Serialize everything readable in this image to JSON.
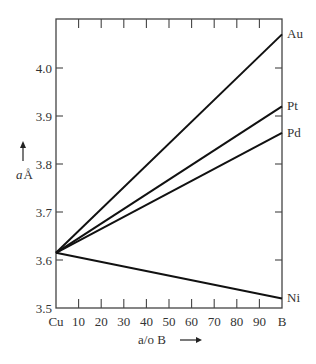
{
  "chart_data": {
    "type": "line",
    "title": "",
    "xlabel": "a/o B",
    "xlabel_arrow": "→",
    "ylabel": "a Å",
    "ylabel_italic_part": "a",
    "ylabel_unit": "Å",
    "ylabel_arrow": "↑",
    "xlim": [
      0,
      100
    ],
    "ylim": [
      3.5,
      4.1
    ],
    "x_ticks": [
      0,
      10,
      20,
      30,
      40,
      50,
      60,
      70,
      80,
      90,
      100
    ],
    "x_tick_labels": [
      "Cu",
      "10",
      "20",
      "30",
      "40",
      "50",
      "60",
      "70",
      "80",
      "90",
      "B"
    ],
    "y_ticks": [
      3.5,
      3.6,
      3.7,
      3.8,
      3.9,
      4.0
    ],
    "y_tick_labels": [
      "3.5",
      "3.6",
      "3.7",
      "3.8",
      "3.9",
      "4.0"
    ],
    "grid": false,
    "legend_position": "inline-right",
    "series": [
      {
        "name": "Au",
        "x": [
          0,
          100
        ],
        "values": [
          3.615,
          4.07
        ]
      },
      {
        "name": "Pt",
        "x": [
          0,
          100
        ],
        "values": [
          3.615,
          3.92
        ]
      },
      {
        "name": "Pd",
        "x": [
          0,
          100
        ],
        "values": [
          3.615,
          3.865
        ]
      },
      {
        "name": "Ni",
        "x": [
          0,
          100
        ],
        "values": [
          3.615,
          3.52
        ]
      }
    ]
  }
}
